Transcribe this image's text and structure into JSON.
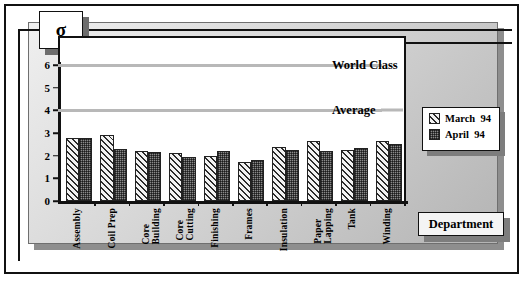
{
  "chart_data": {
    "type": "bar",
    "title": "σ",
    "xlabel": "Department",
    "ylabel": "σ",
    "ylim": [
      0,
      6.5
    ],
    "yticks": [
      0,
      1,
      2,
      3,
      4,
      5,
      6
    ],
    "grid": false,
    "legend_position": "right",
    "categories": [
      "Assembly",
      "Coil Prep",
      "Core\nBuilding",
      "Core\nCutting",
      "Finishing",
      "Frames",
      "Insulation",
      "Paper\nLapping",
      "Tank",
      "Winding"
    ],
    "series": [
      {
        "name": "March  94",
        "values": [
          2.8,
          2.9,
          2.2,
          2.1,
          2.0,
          1.7,
          2.4,
          2.65,
          2.25,
          2.65
        ]
      },
      {
        "name": "April  94",
        "values": [
          2.8,
          2.3,
          2.15,
          1.95,
          2.2,
          1.8,
          2.25,
          2.2,
          2.35,
          2.5
        ]
      }
    ],
    "reference_lines": [
      {
        "label": "World Class",
        "value": 6
      },
      {
        "label": "Average",
        "value": 4
      }
    ]
  },
  "chart": {
    "sigma_symbol": "σ",
    "xaxis_title": "Department",
    "ytick_labels": [
      "6",
      "5",
      "4",
      "3",
      "2",
      "1",
      "0"
    ],
    "reflines": [
      {
        "label": "World Class",
        "value": 6
      },
      {
        "label": "Average",
        "value": 4
      }
    ],
    "legend": {
      "items": [
        {
          "label": "March  94",
          "pattern": "diagonal-hatch"
        },
        {
          "label": "April  94",
          "pattern": "checker-fill"
        }
      ]
    }
  }
}
